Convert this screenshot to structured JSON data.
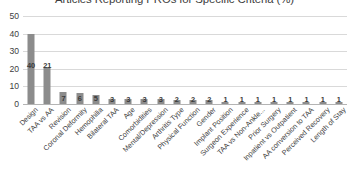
{
  "chart_data": {
    "type": "bar",
    "title": "Articles Reporting PROs for Specific Criteria (%)",
    "xlabel": "",
    "ylabel": "",
    "ylim": [
      0,
      50
    ],
    "yticks": [
      0,
      10,
      20,
      30,
      40,
      50
    ],
    "grid": true,
    "legend": "none",
    "bar_color": "#8c8c8c",
    "categories": [
      "Design",
      "TAA vs AA",
      "Revision",
      "Coronal Deformity",
      "Hemophilia",
      "Bilateral TAA",
      "Age",
      "Comorbidities",
      "Mental/Depression",
      "Arthritis Type",
      "Physical Function",
      "Gender",
      "Implant Position",
      "Surgeon Experience",
      "TAA vs Non-Ankle...",
      "Prior Surgery",
      "Inpatient vs Outpatient",
      "AA conversion to TAA",
      "Perceived Recovery",
      "Length of Stay"
    ],
    "values": [
      40,
      21,
      7,
      6,
      5,
      3,
      3,
      3,
      3,
      2,
      2,
      2,
      1,
      1,
      1,
      1,
      1,
      1,
      1,
      1
    ],
    "data_labels": [
      "40",
      "21",
      "7",
      "6",
      "5",
      "3",
      "3",
      "3",
      "3",
      "2",
      "2",
      "2",
      "1",
      "1",
      "1",
      "1",
      "1",
      "1",
      "1",
      "1"
    ]
  }
}
